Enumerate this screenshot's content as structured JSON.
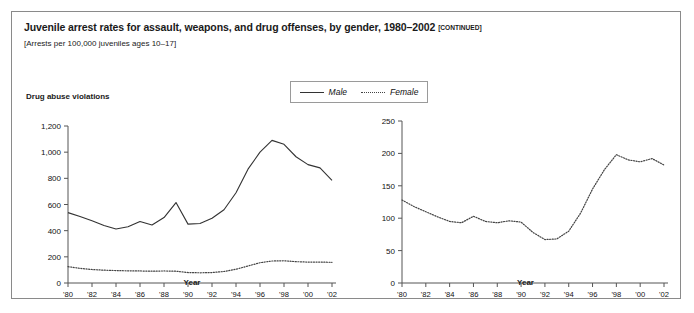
{
  "figure": {
    "title": "Juvenile arrest rates for assault, weapons, and drug offenses, by gender, 1980–2002",
    "title_continued": "[CONTINUED]",
    "subtitle": "[Arrests per 100,000 juveniles ages 10–17]"
  },
  "legend": {
    "male_label": "Male",
    "female_label": "Female",
    "male_style": "solid",
    "female_style": "dotted",
    "position": "top-center"
  },
  "colors": {
    "line": "#333333",
    "dotted_line": "#444444",
    "axis": "#555555",
    "border": "#8a8a8a",
    "text": "#111111"
  },
  "chart_data": [
    {
      "type": "line",
      "panel": "left",
      "title": "Drug abuse violations",
      "xlabel": "Year",
      "ylabel": "",
      "ylim": [
        0,
        1200
      ],
      "yticks": [
        0,
        200,
        400,
        600,
        800,
        1000,
        1200
      ],
      "ytick_labels": [
        "0",
        "200",
        "400",
        "600",
        "800",
        "1,000",
        "1,200"
      ],
      "xlim": [
        1980,
        2002
      ],
      "xticks": [
        1980,
        1982,
        1984,
        1986,
        1988,
        1990,
        1992,
        1994,
        1996,
        1998,
        2000,
        2002
      ],
      "xtick_labels": [
        "'80",
        "'82",
        "'84",
        "'86",
        "'88",
        "'90",
        "'92",
        "'94",
        "'96",
        "'98",
        "'00",
        "'02"
      ],
      "grid": false,
      "x": [
        1980,
        1981,
        1982,
        1983,
        1984,
        1985,
        1986,
        1987,
        1988,
        1989,
        1990,
        1991,
        1992,
        1993,
        1994,
        1995,
        1996,
        1997,
        1998,
        1999,
        2000,
        2001,
        2002
      ],
      "series": [
        {
          "name": "Male",
          "style": "solid",
          "values": [
            538,
            508,
            475,
            440,
            413,
            430,
            470,
            443,
            500,
            615,
            450,
            455,
            495,
            560,
            690,
            870,
            1000,
            1090,
            1060,
            965,
            905,
            880,
            785
          ]
        },
        {
          "name": "Female",
          "style": "dotted",
          "values": [
            125,
            112,
            103,
            98,
            95,
            93,
            92,
            90,
            92,
            90,
            80,
            78,
            80,
            88,
            105,
            130,
            155,
            168,
            170,
            163,
            160,
            160,
            158
          ]
        }
      ]
    },
    {
      "type": "line",
      "panel": "right",
      "title": "",
      "xlabel": "Year",
      "ylabel": "",
      "ylim": [
        0,
        250
      ],
      "yticks": [
        0,
        50,
        100,
        150,
        200,
        250
      ],
      "ytick_labels": [
        "0",
        "50",
        "100",
        "150",
        "200",
        "250"
      ],
      "xlim": [
        1980,
        2002
      ],
      "xticks": [
        1980,
        1982,
        1984,
        1986,
        1988,
        1990,
        1992,
        1994,
        1996,
        1998,
        2000,
        2002
      ],
      "xtick_labels": [
        "'80",
        "'82",
        "'84",
        "'86",
        "'88",
        "'90",
        "'92",
        "'94",
        "'96",
        "'98",
        "'00",
        "'02"
      ],
      "grid": false,
      "x": [
        1980,
        1981,
        1982,
        1983,
        1984,
        1985,
        1986,
        1987,
        1988,
        1989,
        1990,
        1991,
        1992,
        1993,
        1994,
        1995,
        1996,
        1997,
        1998,
        1999,
        2000,
        2001,
        2002
      ],
      "series": [
        {
          "name": "Female",
          "style": "dotted",
          "values": [
            128,
            118,
            110,
            102,
            95,
            93,
            103,
            95,
            93,
            96,
            94,
            78,
            67,
            68,
            80,
            108,
            145,
            175,
            198,
            190,
            187,
            192,
            182
          ]
        }
      ]
    }
  ]
}
